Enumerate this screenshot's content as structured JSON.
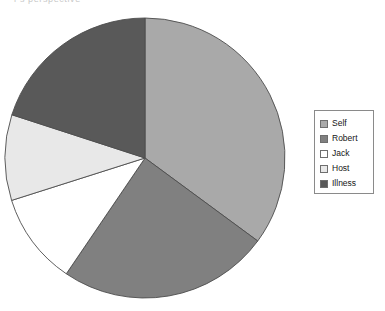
{
  "caption": {
    "clipped_text": "r's perspective"
  },
  "legend": {
    "position": "right",
    "items": [
      {
        "label": "Self",
        "color": "#a9a9a9"
      },
      {
        "label": "Robert",
        "color": "#808080"
      },
      {
        "label": "Jack",
        "color": "#ffffff"
      },
      {
        "label": "Host",
        "color": "#e8e8e8"
      },
      {
        "label": "Illness",
        "color": "#595959"
      }
    ]
  },
  "pie": {
    "center_x": 145,
    "center_y": 150,
    "radius": 140,
    "stroke_color": "#4d4d4d",
    "start_angle_deg": 0
  },
  "chart_data": {
    "type": "pie",
    "title": "",
    "subtitle": "",
    "xlabel": "",
    "ylabel": "",
    "grid": false,
    "legend_position": "right",
    "categories": [
      "Self",
      "Robert",
      "Jack",
      "Host",
      "Illness"
    ],
    "values": [
      35.1,
      24.4,
      10.6,
      9.9,
      20.0
    ],
    "units": "percent",
    "angles_deg": [
      126.5,
      87.8,
      38.1,
      35.5,
      72.1
    ],
    "colors": [
      "#a9a9a9",
      "#808080",
      "#ffffff",
      "#e8e8e8",
      "#595959"
    ],
    "annotations": []
  }
}
